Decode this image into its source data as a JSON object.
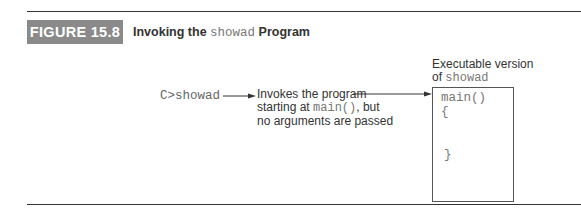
{
  "figure": {
    "badge": "FIGURE 15.8",
    "caption_pre": "Invoking the ",
    "caption_code": "showad",
    "caption_post": " Program"
  },
  "diagram": {
    "command": "C>showad",
    "description_line1": "Invokes the program",
    "description_line2_pre": "starting at ",
    "description_line2_code": "main()",
    "description_line2_post": ", but",
    "description_line3": "no arguments are passed",
    "executable_label_line1": "Executable version",
    "executable_label_line2_pre": "of ",
    "executable_label_line2_code": "showad",
    "code_lines": [
      "main()",
      "{",
      "}"
    ]
  }
}
